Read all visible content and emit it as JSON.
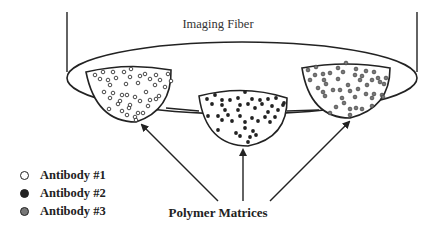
{
  "diagram": {
    "title_top": "Imaging Fiber",
    "title_bottom": "Polymer Matrices",
    "matrices": [
      {
        "name": "left-matrix",
        "antibody": "Antibody #1",
        "fill": "#ffffff"
      },
      {
        "name": "center-matrix",
        "antibody": "Antibody #2",
        "fill": "#222222"
      },
      {
        "name": "right-matrix",
        "antibody": "Antibody #3",
        "fill": "#777777"
      }
    ],
    "legend": [
      {
        "label": "Antibody #1",
        "color": "#ffffff",
        "style": "open"
      },
      {
        "label": "Antibody #2",
        "color": "#222222",
        "style": "filled-black"
      },
      {
        "label": "Antibody #3",
        "color": "#777777",
        "style": "filled-gray"
      }
    ]
  }
}
